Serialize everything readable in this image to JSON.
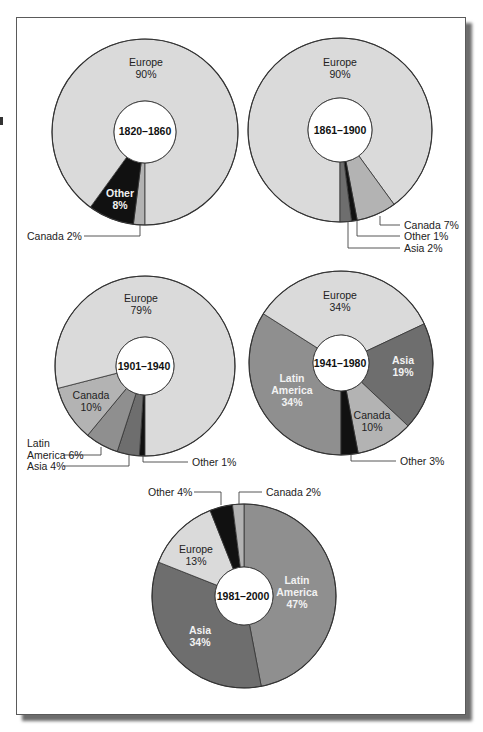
{
  "colors": {
    "Europe": "#dadada",
    "Canada": "#b3b3b3",
    "Latin America": "#8f8f8f",
    "Asia": "#6e6e6e",
    "Other": "#111111",
    "stroke": "#333333"
  },
  "chart_data": [
    {
      "type": "pie",
      "title": "1820–1860",
      "categories": [
        "Europe",
        "Other",
        "Canada"
      ],
      "values": [
        90,
        8,
        2
      ],
      "labels": {
        "europe": "Europe",
        "europe_pct": "90%",
        "other": "Other",
        "other_pct": "8%",
        "canada": "Canada 2%"
      }
    },
    {
      "type": "pie",
      "title": "1861–1900",
      "categories": [
        "Europe",
        "Canada",
        "Other",
        "Asia"
      ],
      "values": [
        90,
        7,
        1,
        2
      ],
      "labels": {
        "europe": "Europe",
        "europe_pct": "90%",
        "canada": "Canada 7%",
        "other": "Other 1%",
        "asia": "Asia 2%"
      }
    },
    {
      "type": "pie",
      "title": "1901–1940",
      "categories": [
        "Europe",
        "Canada",
        "Latin America",
        "Asia",
        "Other"
      ],
      "values": [
        79,
        10,
        6,
        4,
        1
      ],
      "labels": {
        "europe": "Europe",
        "europe_pct": "79%",
        "canada": "Canada",
        "canada_pct": "10%",
        "latin_1": "Latin",
        "latin_2": "America 6%",
        "asia": "Asia 4%",
        "other": "Other 1%"
      }
    },
    {
      "type": "pie",
      "title": "1941–1980",
      "categories": [
        "Europe",
        "Asia",
        "Canada",
        "Other",
        "Latin America"
      ],
      "values": [
        34,
        19,
        10,
        3,
        34
      ],
      "labels": {
        "europe": "Europe",
        "europe_pct": "34%",
        "asia": "Asia",
        "asia_pct": "19%",
        "canada": "Canada",
        "canada_pct": "10%",
        "other": "Other 3%",
        "latin_1": "Latin",
        "latin_2": "America",
        "latin_pct": "34%"
      }
    },
    {
      "type": "pie",
      "title": "1981–2000",
      "categories": [
        "Latin America",
        "Asia",
        "Europe",
        "Other",
        "Canada"
      ],
      "values": [
        47,
        34,
        13,
        4,
        2
      ],
      "labels": {
        "latin_1": "Latin",
        "latin_2": "America",
        "latin_pct": "47%",
        "asia": "Asia",
        "asia_pct": "34%",
        "europe": "Europe",
        "europe_pct": "13%",
        "other": "Other 4%",
        "canada": "Canada 2%"
      }
    }
  ]
}
